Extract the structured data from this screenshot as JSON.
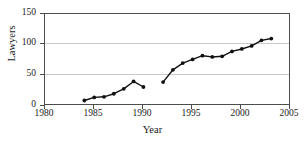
{
  "chart_data": {
    "type": "line",
    "title": "",
    "xlabel": "Year",
    "ylabel": "Lawyers",
    "xlim": [
      1980,
      2005
    ],
    "ylim": [
      0,
      150
    ],
    "xticks": [
      1980,
      1985,
      1990,
      1995,
      2000,
      2005
    ],
    "yticks": [
      0,
      50,
      100,
      150
    ],
    "grid": "horizontal",
    "legend": "none",
    "marker": "filled-circle",
    "series": [
      {
        "name": "segment-1",
        "x": [
          1984,
          1985,
          1986,
          1987,
          1988,
          1989,
          1990
        ],
        "values": [
          9,
          14,
          15,
          20,
          28,
          40,
          31
        ]
      },
      {
        "name": "segment-2",
        "x": [
          1992,
          1993,
          1994,
          1995,
          1996,
          1997,
          1998,
          1999,
          2000,
          2001,
          2002,
          2003
        ],
        "values": [
          39,
          59,
          70,
          76,
          82,
          80,
          81,
          89,
          93,
          98,
          107,
          110
        ]
      }
    ]
  },
  "axes": {
    "y_title": "Lawyers",
    "x_title": "Year",
    "y_tick_labels": [
      "0",
      "50",
      "100",
      "150"
    ],
    "x_tick_labels": [
      "1980",
      "1985",
      "1990",
      "1995",
      "2000",
      "2005"
    ]
  },
  "colors": {
    "line": "#111111",
    "marker": "#111111",
    "grid": "#c9c9c9",
    "frame": "#4d4d4d",
    "background": "#ffffff"
  }
}
